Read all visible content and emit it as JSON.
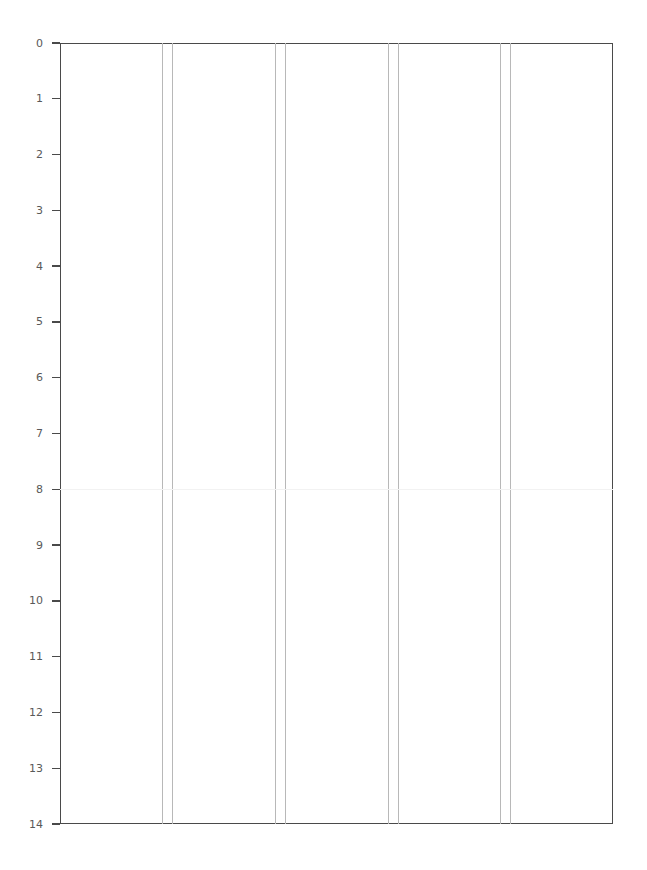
{
  "chart_data": {
    "type": "table",
    "title": "",
    "subtitle": "",
    "xlabel": "",
    "ylabel": "",
    "legend": [],
    "grid": false,
    "legend_position": "none",
    "y_axis": {
      "inverted": true,
      "ylim": [
        0,
        14
      ],
      "tick_labels": [
        "0",
        "1",
        "2",
        "3",
        "4",
        "5",
        "6",
        "7",
        "8",
        "9",
        "10",
        "11",
        "12",
        "13",
        "14"
      ],
      "tick_values": [
        0,
        1,
        2,
        3,
        4,
        5,
        6,
        7,
        8,
        9,
        10,
        11,
        12,
        13,
        14
      ],
      "tick_step": 1
    },
    "x_axis": {
      "tick_labels": [],
      "tick_values": [],
      "xlim": [
        0,
        553
      ],
      "visible_ticks": false
    },
    "column_separators": {
      "description": "paired vertical rule lines dividing the plot into six column bands",
      "pairs": [
        {
          "left": 162,
          "right": 172
        },
        {
          "left": 275,
          "right": 285
        },
        {
          "left": 388,
          "right": 398
        },
        {
          "left": 500,
          "right": 510
        }
      ]
    },
    "row_rules": [
      {
        "value": 8,
        "style": "faint"
      }
    ],
    "series": [],
    "values": [],
    "categories": [],
    "colors": {
      "background": "#ffffff",
      "spine": "#4a4a4a",
      "separator": "#b8b8b8",
      "faint_rule": "#f2f2f2",
      "tick_label": "#595959"
    }
  }
}
